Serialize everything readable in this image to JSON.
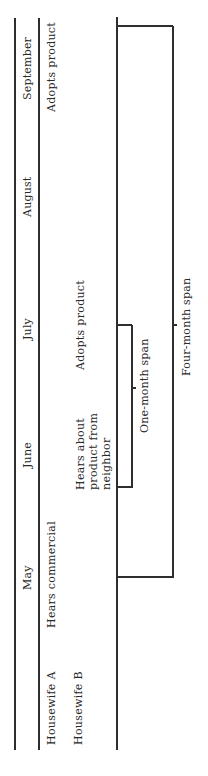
{
  "diagram": {
    "orientation": "rotated-90-ccw",
    "header": {
      "months": [
        "May",
        "June",
        "July",
        "August",
        "September"
      ]
    },
    "rows": [
      {
        "label": "Housewife A",
        "events": [
          {
            "month": "May",
            "text": "Hears commercial"
          },
          {
            "month": "September",
            "text": "Adopts product"
          }
        ]
      },
      {
        "label": "Housewife B",
        "events": [
          {
            "month": "June",
            "text_lines": [
              "Hears about",
              "product from",
              "neighbor"
            ]
          },
          {
            "month": "July",
            "text": "Adopts product"
          }
        ]
      }
    ],
    "spans": [
      {
        "label": "One-month span",
        "from": "June",
        "to": "July"
      },
      {
        "label": "Four-month span",
        "from": "May",
        "to": "September"
      }
    ]
  },
  "text": {
    "may": "May",
    "june": "June",
    "july": "July",
    "august": "August",
    "september": "September",
    "housewife_a": "Housewife A",
    "housewife_b": "Housewife B",
    "a_may": "Hears commercial",
    "a_sep": "Adopts product",
    "b_june_1": "Hears about",
    "b_june_2": "product from",
    "b_june_3": "neighbor",
    "b_july": "Adopts product",
    "one_month": "One-month span",
    "four_month": "Four-month span"
  }
}
